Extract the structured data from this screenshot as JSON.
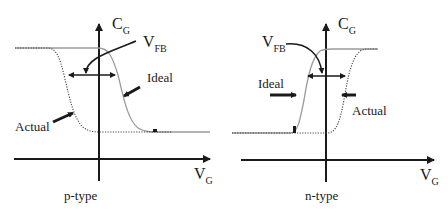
{
  "diagram": {
    "panels": [
      {
        "name": "p-type",
        "caption": "p-type",
        "y_axis": {
          "label_main": "C",
          "label_sub": "G"
        },
        "x_axis": {
          "label_main": "V",
          "label_sub": "G"
        },
        "annotations": {
          "vfb_main": "V",
          "vfb_sub": "FB",
          "ideal": "Ideal",
          "actual": "Actual"
        },
        "curves": [
          {
            "name": "Ideal",
            "style": "solid-gray",
            "transition": "high-to-low",
            "shift": "none"
          },
          {
            "name": "Actual",
            "style": "dotted",
            "transition": "high-to-low",
            "shift": "negative"
          }
        ]
      },
      {
        "name": "n-type",
        "caption": "n-type",
        "y_axis": {
          "label_main": "C",
          "label_sub": "G"
        },
        "x_axis": {
          "label_main": "V",
          "label_sub": "G"
        },
        "annotations": {
          "vfb_main": "V",
          "vfb_sub": "FB",
          "ideal": "Ideal",
          "actual": "Actual"
        },
        "curves": [
          {
            "name": "Ideal",
            "style": "solid-gray",
            "transition": "low-to-high",
            "shift": "none"
          },
          {
            "name": "Actual",
            "style": "dotted",
            "transition": "low-to-high",
            "shift": "positive"
          }
        ]
      }
    ],
    "colors": {
      "axis": "#1a1a1a",
      "ideal": "#9a9a9a",
      "actual": "#555555"
    }
  }
}
